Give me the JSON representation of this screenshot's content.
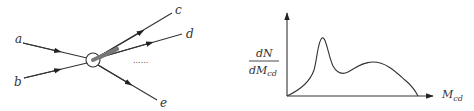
{
  "feynman_diagram": {
    "incoming": [
      {
        "label": "a"
      },
      {
        "label": "b"
      }
    ],
    "outgoing": [
      {
        "label": "c"
      },
      {
        "label": "d"
      },
      {
        "label": "e"
      }
    ],
    "ellipsis": "......",
    "vertex": "interaction-blob",
    "resonance_band_between": [
      "c",
      "d"
    ]
  },
  "distribution_plot": {
    "y_label_numerator": "dN",
    "y_label_denominator": "dM",
    "y_label_denominator_sub": "cd",
    "x_label": "M",
    "x_label_sub": "cd",
    "shape": "narrow resonance peak followed by broad continuum bump",
    "colors": {
      "ink": "#333333",
      "band": "#777777"
    }
  }
}
